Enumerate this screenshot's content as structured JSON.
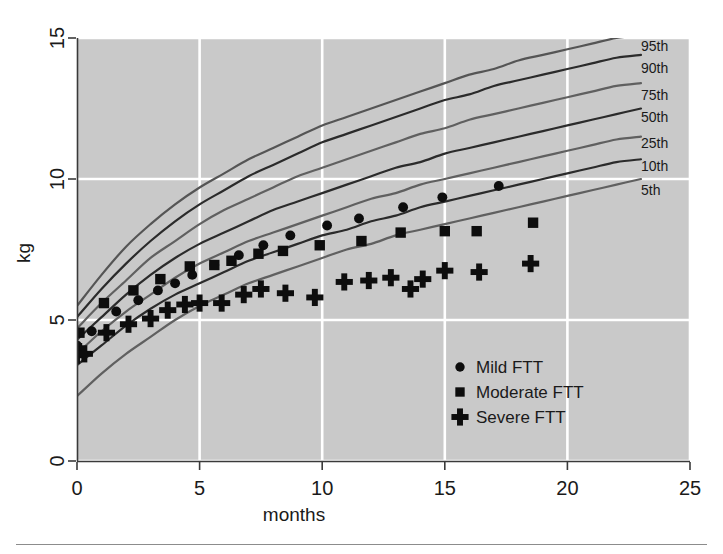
{
  "chart_data": {
    "type": "line",
    "title": "",
    "xlabel": "months",
    "ylabel": "kg",
    "xlim": [
      0,
      25
    ],
    "ylim": [
      0,
      15
    ],
    "xticks": [
      0,
      5,
      10,
      15,
      20,
      25
    ],
    "yticks": [
      0,
      5,
      10,
      15
    ],
    "xtick_labels": [
      "0",
      "5",
      "10",
      "15",
      "20",
      "25"
    ],
    "ytick_labels": [
      "0",
      "5",
      "10",
      "15"
    ],
    "grid": true,
    "grid_color": "#ffffff",
    "plot_background": "#c9c9c9",
    "figure_background": "#ffffff",
    "legend_position": "lower-right-inside",
    "annotations": [
      "95th",
      "90th",
      "75th",
      "50th",
      "25th",
      "10th",
      "5th"
    ],
    "reference_curve_label_text": [
      "95th",
      "90th",
      "75th",
      "50th",
      "25th",
      "10th",
      "5th"
    ],
    "series": [
      {
        "name": "95th",
        "kind": "percentile-curve",
        "color": "#555555",
        "x": [
          0,
          1,
          2,
          3,
          4,
          5,
          6,
          7,
          8,
          9,
          10,
          11,
          12,
          13,
          14,
          15,
          16,
          17,
          18,
          19,
          20,
          21,
          22,
          23
        ],
        "values": [
          5.5,
          6.6,
          7.6,
          8.4,
          9.1,
          9.7,
          10.2,
          10.7,
          11.1,
          11.5,
          11.9,
          12.2,
          12.5,
          12.8,
          13.1,
          13.4,
          13.7,
          13.9,
          14.2,
          14.4,
          14.6,
          14.8,
          15.0,
          15.1
        ]
      },
      {
        "name": "90th",
        "kind": "percentile-curve",
        "color": "#2b2b2b",
        "x": [
          0,
          1,
          2,
          3,
          4,
          5,
          6,
          7,
          8,
          9,
          10,
          11,
          12,
          13,
          14,
          15,
          16,
          17,
          18,
          19,
          20,
          21,
          22,
          23
        ],
        "values": [
          5.1,
          6.1,
          7.0,
          7.8,
          8.5,
          9.1,
          9.6,
          10.1,
          10.5,
          10.9,
          11.3,
          11.6,
          11.9,
          12.2,
          12.5,
          12.8,
          13.0,
          13.3,
          13.5,
          13.7,
          13.9,
          14.1,
          14.3,
          14.4
        ]
      },
      {
        "name": "75th",
        "kind": "percentile-curve",
        "color": "#606060",
        "x": [
          0,
          1,
          2,
          3,
          4,
          5,
          6,
          7,
          8,
          9,
          10,
          11,
          12,
          13,
          14,
          15,
          16,
          17,
          18,
          19,
          20,
          21,
          22,
          23
        ],
        "values": [
          4.7,
          5.6,
          6.4,
          7.2,
          7.8,
          8.4,
          8.9,
          9.3,
          9.7,
          10.1,
          10.4,
          10.7,
          11.0,
          11.3,
          11.6,
          11.8,
          12.1,
          12.3,
          12.5,
          12.7,
          12.9,
          13.1,
          13.3,
          13.4
        ]
      },
      {
        "name": "50th",
        "kind": "percentile-curve",
        "color": "#2b2b2b",
        "x": [
          0,
          1,
          2,
          3,
          4,
          5,
          6,
          7,
          8,
          9,
          10,
          11,
          12,
          13,
          14,
          15,
          16,
          17,
          18,
          19,
          20,
          21,
          22,
          23
        ],
        "values": [
          4.3,
          5.1,
          5.9,
          6.6,
          7.2,
          7.7,
          8.1,
          8.5,
          8.9,
          9.2,
          9.5,
          9.8,
          10.1,
          10.4,
          10.6,
          10.9,
          11.1,
          11.3,
          11.5,
          11.7,
          11.9,
          12.1,
          12.3,
          12.5
        ]
      },
      {
        "name": "25th",
        "kind": "percentile-curve",
        "color": "#606060",
        "x": [
          0,
          1,
          2,
          3,
          4,
          5,
          6,
          7,
          8,
          9,
          10,
          11,
          12,
          13,
          14,
          15,
          16,
          17,
          18,
          19,
          20,
          21,
          22,
          23
        ],
        "values": [
          3.8,
          4.6,
          5.3,
          5.9,
          6.5,
          7.0,
          7.4,
          7.8,
          8.1,
          8.4,
          8.7,
          9.0,
          9.3,
          9.5,
          9.8,
          10.0,
          10.2,
          10.4,
          10.6,
          10.8,
          11.0,
          11.2,
          11.4,
          11.5
        ]
      },
      {
        "name": "10th",
        "kind": "percentile-curve",
        "color": "#2b2b2b",
        "x": [
          0,
          1,
          2,
          3,
          4,
          5,
          6,
          7,
          8,
          9,
          10,
          11,
          12,
          13,
          14,
          15,
          16,
          17,
          18,
          19,
          20,
          21,
          22,
          23
        ],
        "values": [
          3.4,
          4.1,
          4.8,
          5.4,
          5.9,
          6.3,
          6.7,
          7.1,
          7.4,
          7.7,
          8.0,
          8.2,
          8.5,
          8.7,
          9.0,
          9.2,
          9.4,
          9.6,
          9.8,
          10.0,
          10.2,
          10.4,
          10.6,
          10.7
        ]
      },
      {
        "name": "5th",
        "kind": "percentile-curve",
        "color": "#606060",
        "x": [
          0,
          1,
          2,
          3,
          4,
          5,
          6,
          7,
          8,
          9,
          10,
          11,
          12,
          13,
          14,
          15,
          16,
          17,
          18,
          19,
          20,
          21,
          22,
          23
        ],
        "values": [
          2.3,
          3.1,
          3.8,
          4.4,
          5.0,
          5.5,
          5.9,
          6.3,
          6.6,
          6.9,
          7.2,
          7.5,
          7.7,
          8.0,
          8.2,
          8.4,
          8.6,
          8.8,
          9.0,
          9.2,
          9.4,
          9.6,
          9.8,
          10.0
        ]
      },
      {
        "name": "Mild FTT",
        "kind": "scatter",
        "marker": "circle",
        "color": "#0d0d0d",
        "points": [
          [
            0.0,
            4.1
          ],
          [
            0.6,
            4.6
          ],
          [
            1.6,
            5.3
          ],
          [
            2.5,
            5.7
          ],
          [
            3.3,
            6.05
          ],
          [
            4.0,
            6.3
          ],
          [
            4.7,
            6.6
          ],
          [
            5.6,
            6.95
          ],
          [
            6.6,
            7.3
          ],
          [
            7.6,
            7.65
          ],
          [
            8.7,
            8.0
          ],
          [
            10.2,
            8.35
          ],
          [
            11.5,
            8.6
          ],
          [
            13.3,
            9.0
          ],
          [
            14.9,
            9.35
          ],
          [
            17.2,
            9.75
          ]
        ]
      },
      {
        "name": "Moderate FTT",
        "kind": "scatter",
        "marker": "square",
        "color": "#0d0d0d",
        "points": [
          [
            0.0,
            4.0
          ],
          [
            0.1,
            4.55
          ],
          [
            1.1,
            5.6
          ],
          [
            2.3,
            6.05
          ],
          [
            3.4,
            6.45
          ],
          [
            4.6,
            6.9
          ],
          [
            5.6,
            6.95
          ],
          [
            6.3,
            7.1
          ],
          [
            7.4,
            7.35
          ],
          [
            8.4,
            7.45
          ],
          [
            9.9,
            7.65
          ],
          [
            11.6,
            7.8
          ],
          [
            13.2,
            8.1
          ],
          [
            15.0,
            8.15
          ],
          [
            16.3,
            8.15
          ],
          [
            18.6,
            8.45
          ]
        ]
      },
      {
        "name": "Severe FTT",
        "kind": "scatter",
        "marker": "plus",
        "color": "#0d0d0d",
        "points": [
          [
            0.0,
            3.75
          ],
          [
            0.3,
            3.8
          ],
          [
            1.2,
            4.55
          ],
          [
            2.1,
            4.85
          ],
          [
            3.0,
            5.05
          ],
          [
            3.7,
            5.35
          ],
          [
            4.4,
            5.55
          ],
          [
            5.0,
            5.6
          ],
          [
            5.9,
            5.6
          ],
          [
            6.8,
            5.9
          ],
          [
            7.5,
            6.1
          ],
          [
            8.5,
            5.95
          ],
          [
            9.7,
            5.8
          ],
          [
            10.9,
            6.35
          ],
          [
            11.9,
            6.4
          ],
          [
            12.8,
            6.5
          ],
          [
            13.6,
            6.1
          ],
          [
            14.1,
            6.45
          ],
          [
            15.0,
            6.75
          ],
          [
            16.4,
            6.7
          ],
          [
            18.5,
            7.0
          ]
        ]
      }
    ]
  },
  "legend": {
    "entries": [
      {
        "label": "Mild FTT",
        "marker": "circle"
      },
      {
        "label": "Moderate FTT",
        "marker": "square"
      },
      {
        "label": "Severe FTT",
        "marker": "plus"
      }
    ]
  },
  "axis": {
    "x_title": "months",
    "y_title": "kg"
  }
}
